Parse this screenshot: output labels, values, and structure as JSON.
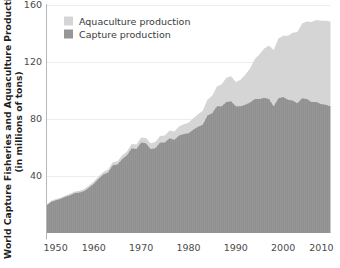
{
  "chart_data": {
    "type": "area",
    "stacked": true,
    "title": "",
    "subtitle": "",
    "xlabel": "",
    "ylabel": "World Capture Fisheries and Aquaculture Production (in millions of tons)",
    "ylabel_line1": "World Capture Fisheries and Aquaculture Production",
    "ylabel_line2": "(in millions of tons)",
    "xlim": [
      1950,
      2010
    ],
    "ylim": [
      0,
      160
    ],
    "xticks": [
      1950,
      1960,
      1970,
      1980,
      1990,
      2000,
      2010
    ],
    "xtick_labels": [
      "1950",
      "1960",
      "1970",
      "1980",
      "1990",
      "2000",
      "2010"
    ],
    "yticks": [
      40,
      80,
      120,
      160
    ],
    "ytick_labels": [
      "40",
      "80",
      "120",
      "160"
    ],
    "grid": "horizontal",
    "legend_position": "top-left-inside",
    "x": [
      1950,
      1951,
      1952,
      1953,
      1954,
      1955,
      1956,
      1957,
      1958,
      1959,
      1960,
      1961,
      1962,
      1963,
      1964,
      1965,
      1966,
      1967,
      1968,
      1969,
      1970,
      1971,
      1972,
      1973,
      1974,
      1975,
      1976,
      1977,
      1978,
      1979,
      1980,
      1981,
      1982,
      1983,
      1984,
      1985,
      1986,
      1987,
      1988,
      1989,
      1990,
      1991,
      1992,
      1993,
      1994,
      1995,
      1996,
      1997,
      1998,
      1999,
      2000,
      2001,
      2002,
      2003,
      2004,
      2005,
      2006,
      2007,
      2008,
      2009,
      2010
    ],
    "series": [
      {
        "name": "Capture production",
        "color": "#969696",
        "values": [
          19.3,
          22.0,
          23.0,
          24.0,
          25.5,
          26.5,
          28.0,
          28.5,
          29.5,
          32.0,
          34.5,
          38.0,
          41.0,
          42.5,
          47.5,
          48.0,
          52.0,
          54.5,
          59.5,
          59.0,
          63.5,
          63.0,
          59.0,
          59.5,
          63.5,
          63.5,
          66.5,
          65.5,
          68.5,
          69.5,
          70.0,
          72.5,
          74.5,
          76.0,
          82.5,
          84.0,
          89.0,
          89.0,
          92.0,
          92.5,
          89.0,
          89.0,
          90.0,
          91.5,
          94.0,
          94.0,
          95.0,
          94.0,
          89.0,
          94.5,
          95.5,
          93.5,
          93.0,
          91.0,
          94.5,
          94.0,
          92.0,
          92.0,
          90.5,
          90.0,
          89.0
        ]
      },
      {
        "name": "Aquaculture production",
        "color": "#d5d5d5",
        "values": [
          0.6,
          0.7,
          0.8,
          0.8,
          0.9,
          1.0,
          1.1,
          1.2,
          1.3,
          1.4,
          1.6,
          1.7,
          1.8,
          2.0,
          2.1,
          2.3,
          2.5,
          2.7,
          2.9,
          3.1,
          3.5,
          3.7,
          4.0,
          4.3,
          4.6,
          5.0,
          5.4,
          5.8,
          6.3,
          6.8,
          7.3,
          8.1,
          8.9,
          9.8,
          11.0,
          12.3,
          13.8,
          15.3,
          17.0,
          17.5,
          17.0,
          18.5,
          21.0,
          24.0,
          28.0,
          31.5,
          34.5,
          37.5,
          39.5,
          42.0,
          43.0,
          45.0,
          47.5,
          50.0,
          52.5,
          54.5,
          56.0,
          57.5,
          58.5,
          59.0,
          59.5
        ]
      }
    ],
    "legend": [
      {
        "label": "Aquaculture production",
        "color": "#d5d5d5",
        "swatch": "legend-swatch-aquaculture"
      },
      {
        "label": "Capture production",
        "color": "#969696",
        "swatch": "legend-swatch-capture"
      }
    ],
    "colors": {
      "capture": "#969696",
      "aquaculture": "#d5d5d5",
      "axis": "#b4b4b4",
      "gridline": "#ededed",
      "text": "#4a4a4a",
      "title_text": "#1f1f1f",
      "background": "#ffffff"
    }
  }
}
